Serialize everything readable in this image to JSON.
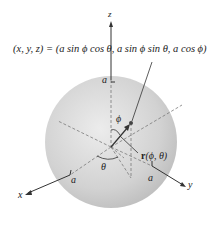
{
  "diagram": {
    "type": "parametrized-sphere",
    "equation": "(x, y, z) = (a sin ϕ cos θ, a sin ϕ sin θ, a cos ϕ)",
    "axes": {
      "x": "x",
      "y": "y",
      "z": "z"
    },
    "radius_labels": {
      "top": "a",
      "x_axis": "a",
      "y_axis": "a"
    },
    "angles": {
      "phi": "ϕ",
      "theta": "θ"
    },
    "vector_label": "r(ϕ, θ)",
    "vector_bold": "r",
    "vector_args": "(ϕ, θ)",
    "colors": {
      "sphere_light": "#e8e8e8",
      "sphere_dark": "#b9b9b9",
      "line": "#333333",
      "dashed": "#7a7a7a",
      "point": "#444444"
    }
  }
}
